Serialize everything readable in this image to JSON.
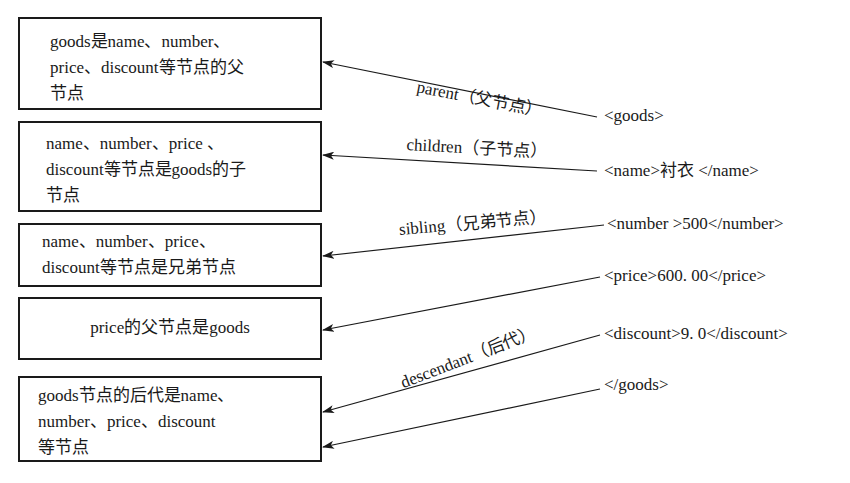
{
  "boxes": [
    {
      "lines": [
        "goods是name、number、",
        "price、discount等节点的父",
        "节点"
      ]
    },
    {
      "lines": [
        "name、number、price 、",
        "discount等节点是goods的子",
        "节点"
      ]
    },
    {
      "lines": [
        "name、number、price、",
        "discount等节点是兄弟节点"
      ]
    },
    {
      "lines": [
        "price的父节点是goods"
      ]
    },
    {
      "lines": [
        "goods节点的后代是name、",
        "number、price、discount",
        "等节点"
      ]
    }
  ],
  "xml_lines": [
    "<goods>",
    "<name>衬衣 </name>",
    "<number >500</number>",
    "<price>600. 00</price>",
    "<discount>9. 0</discount>",
    "</goods>"
  ],
  "relations": [
    {
      "label": "parent（父节点）"
    },
    {
      "label": "children（子节点）"
    },
    {
      "label": "sibling（兄弟节点）"
    },
    {
      "label": "descendant（后代）"
    }
  ],
  "colors": {
    "line": "#1a1a1a",
    "background": "#ffffff"
  }
}
